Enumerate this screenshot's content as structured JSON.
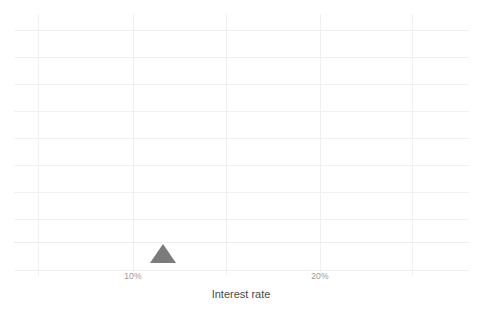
{
  "chart_data": {
    "type": "bar",
    "subtype": "dot-plot",
    "title": "",
    "xlabel": "Interest rate",
    "ylabel": "",
    "grid": true,
    "legend": null,
    "xlim": [
      5.0,
      28.0
    ],
    "ylim": [
      0,
      12
    ],
    "xtick_labels": [
      "10%",
      "20%"
    ],
    "xtick_values": [
      10,
      20
    ],
    "x_unit": "percent",
    "dot_value_per_point": 1,
    "note": "Stacked dot histogram: each dot is one observation; x position is the interest rate bin center.",
    "categories": [
      5.5,
      6.6,
      7.8,
      10.2,
      10.7,
      12.6,
      14.2,
      15.1,
      16.2,
      17.2,
      18.4,
      19.8,
      21.7,
      25.0,
      26.5
    ],
    "values": [
      3,
      5,
      8,
      12,
      8,
      4,
      1,
      1,
      1,
      3,
      2,
      2,
      1,
      1,
      1
    ],
    "series": [
      {
        "name": "Loan count",
        "points": [
          {
            "x": 5.5,
            "count": 3
          },
          {
            "x": 6.6,
            "count": 5
          },
          {
            "x": 7.8,
            "count": 8
          },
          {
            "x": 10.2,
            "count": 12
          },
          {
            "x": 10.7,
            "count": 8
          },
          {
            "x": 12.6,
            "count": 4
          },
          {
            "x": 14.2,
            "count": 1
          },
          {
            "x": 15.1,
            "count": 1
          },
          {
            "x": 16.2,
            "count": 1
          },
          {
            "x": 17.2,
            "count": 3
          },
          {
            "x": 18.4,
            "count": 2
          },
          {
            "x": 19.8,
            "count": 2
          },
          {
            "x": 21.7,
            "count": 1
          },
          {
            "x": 25.0,
            "count": 1
          },
          {
            "x": 26.5,
            "count": 1
          }
        ]
      }
    ],
    "annotations": [
      {
        "name": "mean-marker",
        "shape": "triangle-up",
        "x": 11.6,
        "label": ""
      }
    ],
    "total_observations": 43,
    "colors": {
      "dot": "#7b7b7b",
      "marker": "#7b7b7b",
      "grid": "#f0f0f0",
      "background": "#ffffff",
      "tick_label": "#9a9a9a",
      "axis_title": "#4a4a4a"
    }
  },
  "axis": {
    "x_title": "Interest rate",
    "ticks": [
      {
        "label": "10%",
        "px": 133
      },
      {
        "label": "20%",
        "px": 320
      }
    ]
  },
  "layout": {
    "baseline_y_px": 242,
    "dot_diameter_px": 13.2,
    "gridlines_v_px": [
      38,
      133,
      226,
      320,
      412
    ],
    "gridlines_h_px": [
      30,
      57,
      84,
      111,
      138,
      165,
      192,
      219,
      270
    ],
    "mean_marker_px": 163,
    "x_axis_title_px": 241,
    "tick_label_y_px": 271,
    "axis_title_y_px": 288
  }
}
